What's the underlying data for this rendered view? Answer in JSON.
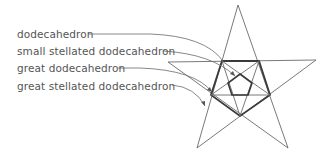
{
  "diagram": {
    "labels": [
      {
        "text": "dodecahedron",
        "x": 17,
        "y": 28
      },
      {
        "text": "small stellated dodecahedron",
        "x": 17,
        "y": 45
      },
      {
        "text": "great dodecahedron",
        "x": 17,
        "y": 62
      },
      {
        "text": "great stellated dodecahedron",
        "x": 17,
        "y": 80
      }
    ],
    "colors": {
      "thin_line": "#6a6a6a",
      "thick_line": "#3a3a3a",
      "text": "#555555"
    }
  }
}
